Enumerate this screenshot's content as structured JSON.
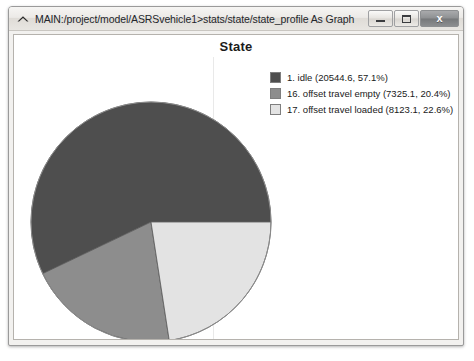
{
  "window": {
    "title": "MAIN:/project/model/ASRSvehicle1>stats/state/state_profile As Graph",
    "icon": "chevron-up-icon",
    "buttons": {
      "minimize": "minimize-icon",
      "maximize": "maximize-icon",
      "close": "x"
    }
  },
  "chart_data": {
    "type": "pie",
    "title": "State",
    "xlabel": "",
    "ylabel": "",
    "grid": true,
    "legend_position": "top-right",
    "start_angle_deg": 0,
    "direction": "counterclockwise",
    "categories": [
      "1. idle",
      "16. offset travel empty",
      "17. offset travel loaded"
    ],
    "values": [
      20544.6,
      7325.1,
      8123.1
    ],
    "percentages": [
      57.1,
      20.4,
      22.6
    ],
    "colors": [
      "#4e4e4e",
      "#8d8d8d",
      "#e3e3e3"
    ],
    "legend_labels": [
      "1. idle (20544.6, 57.1%)",
      "16. offset travel empty (7325.1, 20.4%)",
      "17. offset travel loaded (8123.1, 22.6%)"
    ]
  }
}
